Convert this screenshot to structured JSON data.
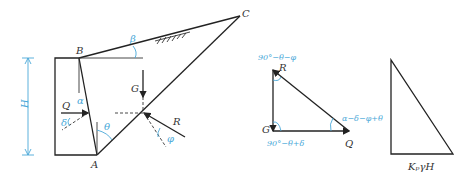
{
  "figure": {
    "wall_diagram": {
      "points": {
        "A": "A",
        "B": "B",
        "C": "C"
      },
      "forces": {
        "Q": "Q",
        "G": "G",
        "R": "R"
      },
      "angles": {
        "alpha": "α",
        "beta": "β",
        "theta": "θ",
        "delta": "δ",
        "phi": "φ"
      },
      "height_label": "H"
    },
    "force_triangle": {
      "vertex_labels": {
        "R": "R",
        "G": "G",
        "Q": "Q"
      },
      "angle_top": "90°−θ−φ",
      "angle_right": "α−δ−φ+θ",
      "angle_bottom": "90°−θ+δ"
    },
    "pressure_diagram": {
      "base_label": "KₚγH"
    },
    "colors": {
      "line": "#222222",
      "annotation": "#4aa8d8"
    }
  }
}
